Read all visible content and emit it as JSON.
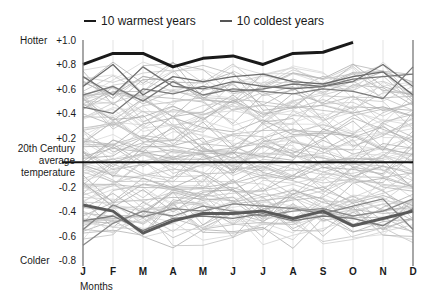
{
  "chart_data": {
    "type": "line",
    "title": "",
    "xlabel": "Months",
    "ylabel": "",
    "ylim": [
      -0.8,
      1.0
    ],
    "categories": [
      "J",
      "F",
      "M",
      "A",
      "M",
      "J",
      "J",
      "A",
      "S",
      "O",
      "N",
      "D"
    ],
    "yticks": [
      "+1.0",
      "+0.8",
      "+0.6",
      "+0.4",
      "+0.2",
      "-0.2",
      "-0.4",
      "-0.6",
      "-0.8"
    ],
    "ytick_values": [
      1.0,
      0.8,
      0.6,
      0.4,
      0.2,
      -0.2,
      -0.4,
      -0.6,
      -0.8
    ],
    "annotations": {
      "top": "Hotter",
      "bottom": "Colder",
      "baseline": [
        "20th Century",
        "average",
        "temperature"
      ]
    },
    "legend": [
      {
        "label": "10 warmest years",
        "color": "#1a1a1a"
      },
      {
        "label": "10 coldest years",
        "color": "#555555"
      }
    ],
    "legend_position": "top",
    "grid": "vertical",
    "series": [
      {
        "name": "Warmest year (highlight)",
        "color": "#1a1a1a",
        "width": 3,
        "values": [
          0.8,
          0.89,
          0.89,
          0.78,
          0.85,
          0.87,
          0.8,
          0.89,
          0.9,
          0.98,
          null,
          null
        ]
      },
      {
        "name": "Coldest year (highlight)",
        "color": "#5a5a5a",
        "width": 3,
        "values": [
          -0.35,
          -0.4,
          -0.58,
          -0.48,
          -0.42,
          -0.42,
          -0.4,
          -0.46,
          -0.4,
          -0.52,
          -0.46,
          -0.4
        ]
      },
      {
        "name": "Warm year 2",
        "color": "#6a6a6a",
        "width": 1.3,
        "values": [
          0.62,
          0.8,
          0.55,
          0.7,
          0.66,
          0.7,
          0.72,
          0.66,
          0.64,
          0.7,
          0.74,
          0.55
        ]
      },
      {
        "name": "Warm year 3",
        "color": "#707070",
        "width": 1.3,
        "values": [
          0.7,
          0.55,
          0.78,
          0.62,
          0.6,
          0.66,
          0.62,
          0.6,
          0.62,
          0.66,
          0.8,
          0.62
        ]
      },
      {
        "name": "Warm year 4",
        "color": "#777777",
        "width": 1.3,
        "values": [
          0.45,
          0.4,
          0.6,
          0.56,
          0.62,
          0.58,
          0.6,
          0.64,
          0.62,
          0.68,
          0.7,
          0.72
        ]
      },
      {
        "name": "Warm year 5",
        "color": "#7a7a7a",
        "width": 1.3,
        "values": [
          0.55,
          0.62,
          0.5,
          0.66,
          0.55,
          0.6,
          0.58,
          0.56,
          0.6,
          0.58,
          0.52,
          0.78
        ]
      },
      {
        "name": "Cold year 2",
        "color": "#7a7a7a",
        "width": 1.3,
        "values": [
          -0.48,
          -0.44,
          -0.56,
          -0.46,
          -0.44,
          -0.46,
          -0.42,
          -0.48,
          -0.44,
          -0.46,
          -0.52,
          -0.38
        ]
      },
      {
        "name": "Cold year 3",
        "color": "#858585",
        "width": 1.3,
        "values": [
          -0.55,
          -0.35,
          -0.45,
          -0.38,
          -0.4,
          -0.34,
          -0.36,
          -0.38,
          -0.42,
          -0.36,
          -0.3,
          -0.55
        ]
      },
      {
        "name": "Cold year 4",
        "color": "#8a8a8a",
        "width": 1.3,
        "values": [
          -0.68,
          -0.5,
          -0.4,
          -0.44,
          -0.36,
          -0.4,
          -0.44,
          -0.4,
          -0.38,
          -0.44,
          -0.4,
          -0.3
        ]
      }
    ]
  },
  "legend": {
    "warm_label": "10 warmest years",
    "cold_label": "10 coldest years"
  }
}
